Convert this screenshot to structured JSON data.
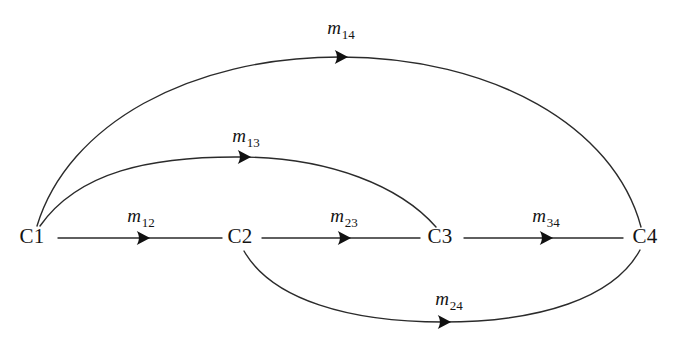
{
  "figure": {
    "background_color": "#ffffff",
    "line_color": "#2b2b2b",
    "text_color": "#141414"
  },
  "nodes": [
    {
      "id": "C1",
      "label": "C1",
      "x": 32,
      "y": 238
    },
    {
      "id": "C2",
      "label": "C2",
      "x": 240,
      "y": 238
    },
    {
      "id": "C3",
      "label": "C3",
      "x": 440,
      "y": 238
    },
    {
      "id": "C4",
      "label": "C4",
      "x": 645,
      "y": 238
    }
  ],
  "edges": [
    {
      "id": "m12",
      "from": "C1",
      "to": "C2",
      "label_base": "m",
      "label_sub": "12",
      "label_x": 141,
      "label_y": 222,
      "shape": "straight",
      "path": "M 58 238 L 222 238",
      "arrow_x": 142,
      "arrow_y": 238,
      "arrow_angle": 0
    },
    {
      "id": "m23",
      "from": "C2",
      "to": "C3",
      "label_base": "m",
      "label_sub": "23",
      "label_x": 344,
      "label_y": 222,
      "shape": "straight",
      "path": "M 262 238 L 420 238",
      "arrow_x": 343,
      "arrow_y": 238,
      "arrow_angle": 0
    },
    {
      "id": "m34",
      "from": "C3",
      "to": "C4",
      "label_base": "m",
      "label_sub": "34",
      "label_x": 546,
      "label_y": 222,
      "shape": "straight",
      "path": "M 464 238 L 623 238",
      "arrow_x": 545,
      "arrow_y": 238,
      "arrow_angle": 0
    },
    {
      "id": "m13",
      "from": "C1",
      "to": "C3",
      "label_base": "m",
      "label_sub": "13",
      "label_x": 246,
      "label_y": 142,
      "shape": "arc-above",
      "path": "M 40 226 C 78 172, 150 156, 243 157 C 330 158, 400 186, 436 227",
      "arrow_x": 243,
      "arrow_y": 157,
      "arrow_angle": 0
    },
    {
      "id": "m14",
      "from": "C1",
      "to": "C4",
      "label_base": "m",
      "label_sub": "14",
      "label_x": 341,
      "label_y": 34,
      "shape": "arc-above",
      "path": "M 37 226 C 68 124, 190 57, 340 57 C 492 57, 614 126, 641 227",
      "arrow_x": 340,
      "arrow_y": 57,
      "arrow_angle": 0
    },
    {
      "id": "m24",
      "from": "C2",
      "to": "C4",
      "label_base": "m",
      "label_sub": "24",
      "label_x": 449,
      "label_y": 305,
      "shape": "arc-below",
      "path": "M 244 251 C 272 300, 350 322, 443 322 C 540 322, 614 298, 640 250",
      "arrow_x": 443,
      "arrow_y": 322,
      "arrow_angle": 0
    }
  ]
}
